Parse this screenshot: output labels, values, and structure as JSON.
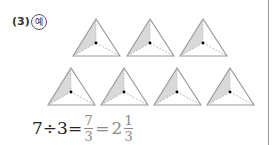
{
  "problem": {
    "number_label": "(3)",
    "example_label": "예"
  },
  "figure": {
    "shape": "triangle-divided-in-3",
    "shaded_parts_per_triangle": 1,
    "total_parts_per_triangle": 3,
    "row1_count": 3,
    "row2_count": 4,
    "shade_color": "#d9d9d9",
    "stroke_color": "#999999"
  },
  "equation": {
    "lhs": "7÷3=",
    "frac1_num": "7",
    "frac1_den": "3",
    "equals2": "=",
    "whole": "2",
    "frac2_num": "1",
    "frac2_den": "3",
    "answer_color": "#8a8a8a"
  }
}
